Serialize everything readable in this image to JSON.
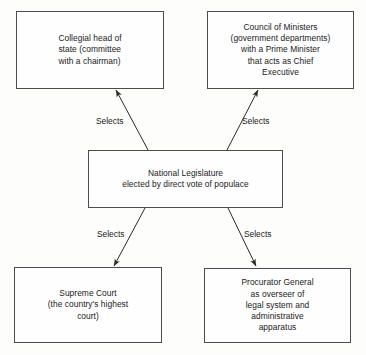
{
  "diagram": {
    "type": "flowchart",
    "background_color": "#fdfdfc",
    "line_color": "#2b2b2b",
    "box_border_color": "#4c4c4c",
    "nodes": [
      {
        "id": "head-of-state",
        "label": "Collegial head of\nstate (committee\nwith a chairman)",
        "align": "left"
      },
      {
        "id": "council-ministers",
        "label": "Council of Ministers\n(government departments)\nwith a Prime Minister\nthat acts as Chief\nExecutive",
        "align": "center"
      },
      {
        "id": "national-legislature",
        "label": "National Legislature\nelected by direct vote of populace",
        "align": "center"
      },
      {
        "id": "supreme-court",
        "label": "Supreme Court\n(the country's highest\ncourt)",
        "align": "center"
      },
      {
        "id": "procurator-general",
        "label": "Procurator General\nas overseer of\nlegal system and\nadministrative\napparatus",
        "align": "center"
      }
    ],
    "edges": [
      {
        "id": "legislature-head-of-state",
        "from": "national-legislature",
        "to": "head-of-state",
        "label": "Selects"
      },
      {
        "id": "legislature-council-ministers",
        "from": "national-legislature",
        "to": "council-ministers",
        "label": "Selects"
      },
      {
        "id": "legislature-supreme-court",
        "from": "national-legislature",
        "to": "supreme-court",
        "label": "Selects"
      },
      {
        "id": "legislature-procurator-general",
        "from": "national-legislature",
        "to": "procurator-general",
        "label": "Selects"
      }
    ]
  }
}
